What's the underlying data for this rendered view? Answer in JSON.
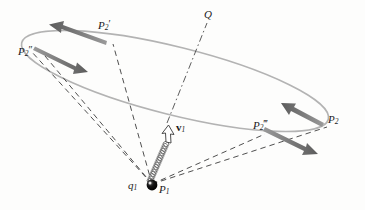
{
  "figure": {
    "background_color": "#fdfdfc",
    "colors": {
      "ellipse_stroke": "#b0b0b0",
      "arrow_gray": "#7a7a7a",
      "arrow_gray_dark": "#5f5f5f",
      "dashed_line": "#3a3a3a",
      "dashdot_line": "#4a4a4a",
      "coil_stroke": "#6e6e6e",
      "particle_fill": "#0d0d0d",
      "label_color": "#1a1a1a"
    },
    "labels": {
      "q1": {
        "base": "q",
        "sub": "1",
        "primes": ""
      },
      "p1": {
        "base": "P",
        "sub": "1",
        "primes": ""
      },
      "p2": {
        "base": "P",
        "sub": "2",
        "primes": ""
      },
      "p2_prime": {
        "base": "P",
        "sub": "2",
        "primes": "′"
      },
      "p2_dprime": {
        "base": "P",
        "sub": "2",
        "primes": "″"
      },
      "p2_tprime": {
        "base": "P",
        "sub": "2",
        "primes": "‴"
      },
      "q_point": {
        "base": "Q",
        "sub": "",
        "primes": ""
      },
      "v1": {
        "base": "v",
        "sub": "1",
        "primes": ""
      }
    },
    "points": {
      "P1": [
        152,
        185
      ],
      "Q": [
        209,
        17
      ],
      "P2": [
        322,
        123
      ],
      "P2_prime": [
        106,
        37
      ],
      "P2_dprime": [
        27,
        54
      ],
      "P2_tprime": [
        265,
        128
      ],
      "v1_tip": [
        172,
        128
      ]
    },
    "ellipse": {
      "cx": 175,
      "cy": 81,
      "rx": 158,
      "ry": 34,
      "rotation_deg": 14
    },
    "arrow_count": 4,
    "dashed_line_count": 4,
    "coil_loop_count": 17
  }
}
